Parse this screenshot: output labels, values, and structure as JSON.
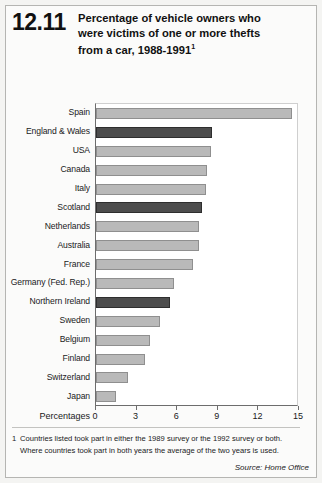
{
  "header": {
    "figure_number": "12.11",
    "title_line1": "Percentage of vehicle owners who",
    "title_line2": "were victims of one or more thefts",
    "title_line3": "from a car, 1988-1991",
    "title_superscript": "1"
  },
  "footnote": {
    "marker": "1",
    "line1": "Countries listed took part in either the 1989 survey or the 1992 survey or both.",
    "line2": "Where countries took part in both years the average of the two years is used."
  },
  "source": "Source: Home Office",
  "colors": {
    "bar_light": "#b9b9b9",
    "bar_light_border": "#8f8f8f",
    "bar_dark": "#4d4d4d",
    "bar_dark_border": "#2e2e2e",
    "axis": "#6d6d6d",
    "page_background": "#f4f4f2",
    "plot_background": "#ffffff"
  },
  "chart_data": {
    "type": "bar",
    "orientation": "horizontal",
    "title": "Percentage of vehicle owners who were victims of one or more thefts from a car, 1988-1991",
    "xlabel": "Percentages",
    "ylabel": "",
    "xlim": [
      0,
      15
    ],
    "xticks": [
      0,
      3,
      6,
      9,
      12,
      15
    ],
    "xticklabels": [
      "0",
      "3",
      "6",
      "9",
      "12",
      "15"
    ],
    "grid": false,
    "legend": null,
    "categories": [
      "Spain",
      "England & Wales",
      "USA",
      "Canada",
      "Italy",
      "Scotland",
      "Netherlands",
      "Australia",
      "France",
      "Germany (Fed. Rep.)",
      "Northern Ireland",
      "Sweden",
      "Belgium",
      "Finland",
      "Switzerland",
      "Japan"
    ],
    "values": [
      14.5,
      8.6,
      8.5,
      8.2,
      8.1,
      7.8,
      7.6,
      7.6,
      7.2,
      5.8,
      5.5,
      4.7,
      4.0,
      3.6,
      2.4,
      1.5
    ],
    "highlight": [
      false,
      true,
      false,
      false,
      false,
      true,
      false,
      false,
      false,
      false,
      true,
      false,
      false,
      false,
      false,
      false
    ]
  }
}
